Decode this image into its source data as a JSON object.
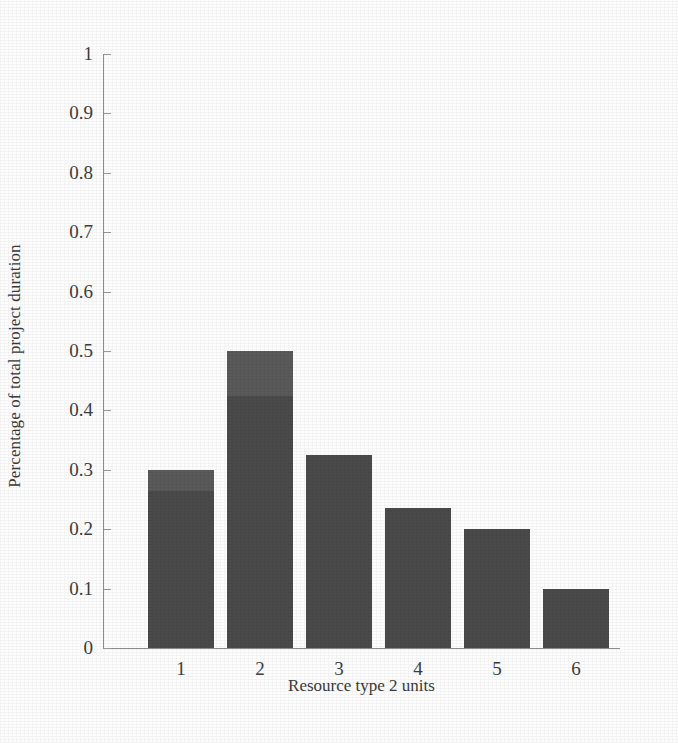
{
  "chart_data": {
    "type": "bar",
    "title": "",
    "xlabel": "Resource type 2 units",
    "ylabel": "Percentage of total project duration",
    "categories": [
      "1",
      "2",
      "3",
      "4",
      "5",
      "6"
    ],
    "values": [
      0.3,
      0.5,
      0.325,
      0.235,
      0.2,
      0.1
    ],
    "series": [
      {
        "name": "lower segment",
        "values": [
          0.265,
          0.425,
          0.325,
          0.235,
          0.2,
          0.1
        ]
      },
      {
        "name": "upper segment",
        "values": [
          0.035,
          0.075,
          0.0,
          0.0,
          0.0,
          0.0
        ]
      }
    ],
    "ylim": [
      0,
      1
    ],
    "xlim_categories": 6,
    "ytick_labels": [
      "0",
      "0.1",
      "0.2",
      "0.3",
      "0.4",
      "0.5",
      "0.6",
      "0.7",
      "0.8",
      "0.9",
      "1"
    ],
    "ytick_values": [
      0,
      0.1,
      0.2,
      0.3,
      0.4,
      0.5,
      0.6,
      0.7,
      0.8,
      0.9,
      1
    ],
    "xtick_labels": [
      "1",
      "2",
      "3",
      "4",
      "5",
      "6"
    ],
    "grid": false,
    "legend": "none",
    "colors": {
      "bar_lower": "#4a4a4a",
      "bar_upper": "#5a5a5a",
      "axis": "#8d8d8d",
      "text": "#3d3d3d",
      "background": "#fdfdfd"
    }
  }
}
